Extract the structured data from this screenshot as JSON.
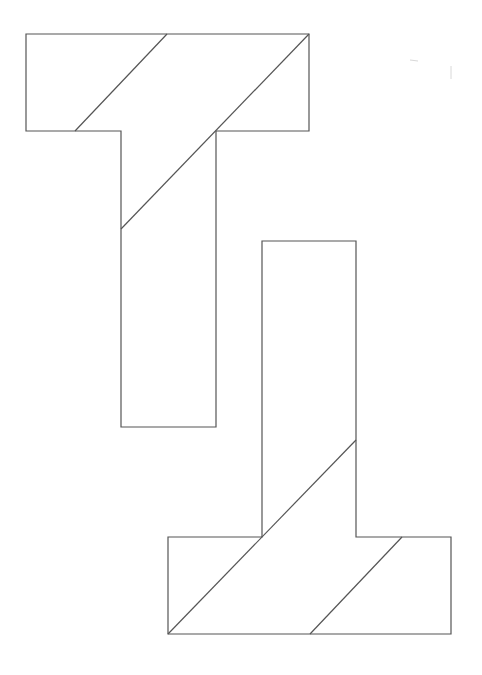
{
  "diagram": {
    "title": "",
    "stroke_color": "#555555",
    "background_color": "#ffffff",
    "shapes": [
      {
        "name": "upper-t",
        "orientation": "upright",
        "outline_points": [
          [
            26,
            34
          ],
          [
            309,
            34
          ],
          [
            309,
            131
          ],
          [
            216,
            131
          ],
          [
            216,
            427
          ],
          [
            121,
            427
          ],
          [
            121,
            131
          ],
          [
            26,
            131
          ]
        ],
        "cut_lines": [
          {
            "from": [
              167,
              34
            ],
            "to": [
              75,
              131
            ]
          },
          {
            "from": [
              309,
              34
            ],
            "to": [
              121,
              229
            ]
          }
        ]
      },
      {
        "name": "lower-t",
        "orientation": "inverted",
        "outline_points": [
          [
            262,
            241
          ],
          [
            356,
            241
          ],
          [
            356,
            537
          ],
          [
            451,
            537
          ],
          [
            451,
            634
          ],
          [
            168,
            634
          ],
          [
            168,
            537
          ],
          [
            262,
            537
          ]
        ],
        "cut_lines": [
          {
            "from": [
              168,
              634
            ],
            "to": [
              356,
              440
            ]
          },
          {
            "from": [
              310,
              634
            ],
            "to": [
              402,
              537
            ]
          }
        ]
      }
    ]
  }
}
